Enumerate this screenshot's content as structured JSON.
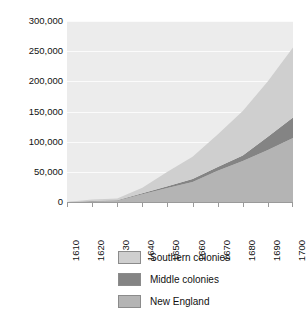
{
  "chart_data": {
    "type": "area",
    "stacked": true,
    "title": "",
    "subtitle": "",
    "xlabel": "",
    "ylabel": "",
    "x": [
      1610,
      1620,
      1630,
      1640,
      1650,
      1660,
      1670,
      1680,
      1690,
      1700
    ],
    "categories": [
      "1610",
      "1620",
      "1630",
      "1640",
      "1650",
      "1660",
      "1670",
      "1680",
      "1690",
      "1700"
    ],
    "xlim": [
      1610,
      1700
    ],
    "ylim": [
      0,
      300000
    ],
    "ytick_labels": [
      "0",
      "50,000",
      "100,000",
      "150,000",
      "200,000",
      "250,000",
      "300,000"
    ],
    "ytick_values": [
      0,
      50000,
      100000,
      150000,
      200000,
      250000,
      300000
    ],
    "grid": true,
    "grid_color": "#fbfbfb",
    "plot_background": "#ececec",
    "legend_position": "bottom",
    "stack_order_bottom_to_top": [
      "New England",
      "Middle colonies",
      "Southern colonies"
    ],
    "series": [
      {
        "name": "New England",
        "color": "#b4b4b4",
        "values": [
          0,
          1000,
          2000,
          13000,
          23000,
          33000,
          52000,
          68000,
          86000,
          106000
        ]
      },
      {
        "name": "Middle colonies",
        "color": "#848484",
        "values": [
          0,
          500,
          700,
          1500,
          3000,
          5000,
          6000,
          9000,
          22000,
          34000
        ]
      },
      {
        "name": "Southern colonies",
        "color": "#cfcfcf",
        "values": [
          0,
          2500,
          3000,
          9000,
          24000,
          37000,
          54000,
          74000,
          92000,
          116000
        ]
      }
    ],
    "cumulative_totals": [
      0,
      4000,
      5700,
      23500,
      50000,
      75000,
      112000,
      151000,
      200000,
      256000
    ]
  },
  "y_axis": {
    "ticks": [
      "300,000",
      "250,000",
      "200,000",
      "150,000",
      "100,000",
      "50,000",
      "0"
    ]
  },
  "x_axis": {
    "ticks": [
      "1610",
      "1620",
      "1630",
      "1640",
      "1650",
      "1660",
      "1670",
      "1680",
      "1690",
      "1700"
    ]
  },
  "legend": {
    "items": [
      {
        "label": "Southern colonies",
        "color": "#cfcfcf"
      },
      {
        "label": "Middle colonies",
        "color": "#848484"
      },
      {
        "label": "New England",
        "color": "#b4b4b4"
      }
    ]
  },
  "footer": {
    "fragment": ""
  }
}
